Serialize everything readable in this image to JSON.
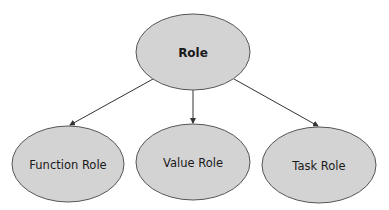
{
  "diagram": {
    "root": {
      "label": "Role",
      "cx": 193,
      "cy": 52,
      "rx": 57,
      "ry": 38
    },
    "children": [
      {
        "label": "Function Role",
        "cx": 68,
        "cy": 164,
        "rx": 56,
        "ry": 38
      },
      {
        "label": "Value Role",
        "cx": 193,
        "cy": 162,
        "rx": 57,
        "ry": 38
      },
      {
        "label": "Task Role",
        "cx": 319,
        "cy": 165,
        "rx": 57,
        "ry": 38
      }
    ],
    "colors": {
      "fill": "#d3d3d3",
      "stroke": "#555555",
      "arrow": "#333333"
    }
  }
}
